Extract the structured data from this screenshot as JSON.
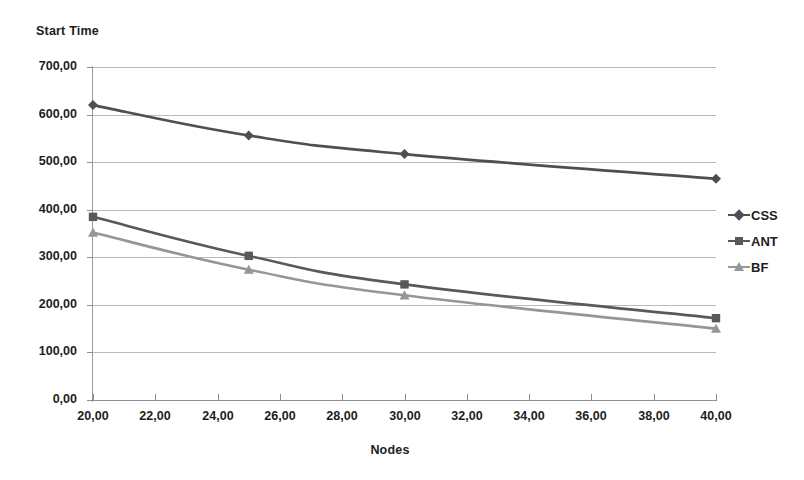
{
  "chart_data": {
    "type": "line",
    "title": "",
    "ylabel": "Start Time",
    "xlabel": "Nodes",
    "x": [
      20,
      25,
      30,
      40
    ],
    "xlim": [
      20,
      40
    ],
    "ylim": [
      0,
      700
    ],
    "xticks": [
      "20,00",
      "22,00",
      "24,00",
      "26,00",
      "28,00",
      "30,00",
      "32,00",
      "34,00",
      "36,00",
      "38,00",
      "40,00"
    ],
    "xtick_values": [
      20,
      22,
      24,
      26,
      28,
      30,
      32,
      34,
      36,
      38,
      40
    ],
    "yticks": [
      "0,00",
      "100,00",
      "200,00",
      "300,00",
      "400,00",
      "500,00",
      "600,00",
      "700,00"
    ],
    "ytick_values": [
      0,
      100,
      200,
      300,
      400,
      500,
      600,
      700
    ],
    "grid": true,
    "legend_position": "right",
    "series": [
      {
        "name": "CSS",
        "marker": "diamond",
        "color": "#4f4f4f",
        "values": [
          620,
          556,
          517,
          465
        ]
      },
      {
        "name": "ANT",
        "marker": "square",
        "color": "#595959",
        "values": [
          385,
          303,
          243,
          172
        ]
      },
      {
        "name": "BF",
        "marker": "triangle",
        "color": "#969696",
        "values": [
          352,
          274,
          220,
          150
        ]
      }
    ]
  },
  "legend": {
    "items": [
      {
        "label": "CSS"
      },
      {
        "label": "ANT"
      },
      {
        "label": "BF"
      }
    ]
  },
  "colors": {
    "css": "#4f4f4f",
    "ant": "#595959",
    "bf": "#969696",
    "grid": "#b9b9b9",
    "axis": "#8e8e8e",
    "text": "#1d1d1b",
    "background": "#ffffff"
  }
}
